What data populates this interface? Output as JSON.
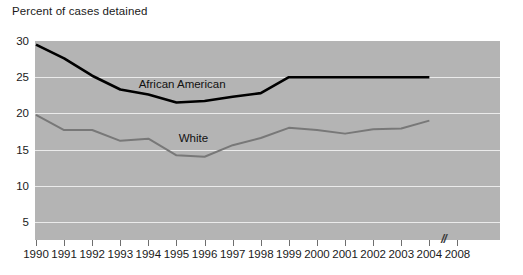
{
  "chart_data": {
    "type": "line",
    "title": "Percent of cases detained",
    "xlabel": "",
    "ylabel": "",
    "x": [
      1990,
      1991,
      1992,
      1993,
      1994,
      1995,
      1996,
      1997,
      1998,
      1999,
      2000,
      2001,
      2002,
      2003,
      2004
    ],
    "xtick_labels": [
      "1990",
      "1991",
      "1992",
      "1993",
      "1994",
      "1995",
      "1996",
      "1997",
      "1998",
      "1999",
      "2000",
      "2001",
      "2002",
      "2003",
      "2004",
      "2008"
    ],
    "ytick_labels": [
      "5",
      "10",
      "15",
      "20",
      "25",
      "30"
    ],
    "ytick_values": [
      5,
      10,
      15,
      20,
      25,
      30
    ],
    "ylim": [
      2.5,
      30
    ],
    "xlim": [
      1990,
      2008
    ],
    "axis_break": {
      "symbol": "//",
      "between": [
        "2004",
        "2008"
      ]
    },
    "grid": "horizontal-white",
    "legend": "inline-labels",
    "plot_background": "#b4b4b4",
    "series": [
      {
        "name": "African American",
        "color": "#000000",
        "label_x": 1995.2,
        "label_y": 24.1,
        "values": [
          29.5,
          27.6,
          25.2,
          23.3,
          22.6,
          21.5,
          21.7,
          22.3,
          22.8,
          25.0,
          25.0,
          25.0,
          25.0,
          25.0,
          25.0
        ]
      },
      {
        "name": "White",
        "color": "#787878",
        "label_x": 1995.6,
        "label_y": 16.6,
        "values": [
          19.8,
          17.7,
          17.7,
          16.2,
          16.5,
          14.2,
          14.0,
          15.6,
          16.6,
          18.0,
          17.7,
          17.2,
          17.8,
          17.9,
          19.0
        ]
      }
    ]
  }
}
